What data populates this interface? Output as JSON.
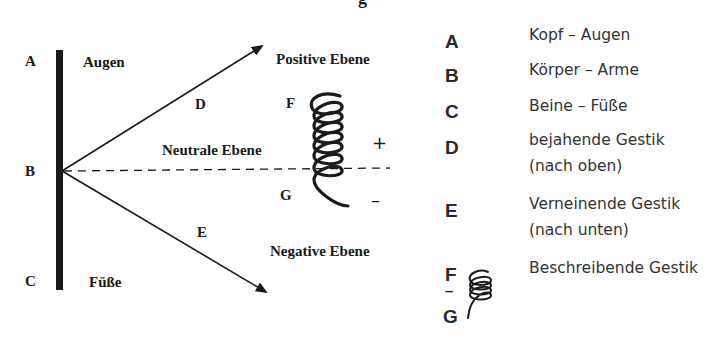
{
  "title_fragment": "g",
  "diagram": {
    "points": {
      "A": "A",
      "B": "B",
      "C": "C"
    },
    "labels": {
      "augen": "Augen",
      "fuesse": "Füße",
      "positive": "Positive Ebene",
      "neutral": "Neutrale Ebene",
      "negative": "Negative Ebene",
      "D": "D",
      "E": "E",
      "F": "F",
      "G": "G",
      "plus": "+",
      "minus": "–"
    }
  },
  "legend": [
    {
      "key": "A",
      "text": "Kopf – Augen"
    },
    {
      "key": "B",
      "text": "Körper – Arme"
    },
    {
      "key": "C",
      "text": "Beine – Füße"
    },
    {
      "key": "D",
      "text": "bejahende Gestik",
      "text2": "(nach oben)"
    },
    {
      "key": "E",
      "text": "Verneinende Gestik",
      "text2": " (nach unten)"
    },
    {
      "key": "F",
      "key_sep": "–",
      "key2": "G",
      "text": "Beschreibende Gestik"
    }
  ]
}
